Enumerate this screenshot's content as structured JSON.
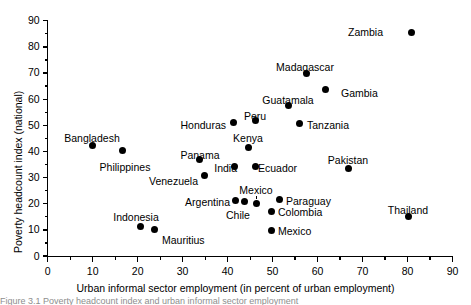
{
  "chart_data": {
    "type": "scatter",
    "title": "",
    "xlabel": "Urban informal sector employment (in percent of urban employment)",
    "ylabel": "Poverty headcount index (national)",
    "xlim": [
      0,
      90
    ],
    "ylim": [
      0,
      90
    ],
    "xticks": [
      0,
      10,
      20,
      30,
      40,
      50,
      60,
      70,
      80,
      90
    ],
    "yticks": [
      0,
      10,
      20,
      30,
      40,
      50,
      60,
      70,
      80,
      90
    ],
    "xtick_labels": [
      "0",
      "10",
      "20",
      "30",
      "40",
      "50",
      "60",
      "70",
      "80",
      "90"
    ],
    "ytick_labels": [
      "0",
      "10",
      "20",
      "30",
      "40",
      "50",
      "60",
      "70",
      "80",
      "90"
    ],
    "minor_ticks": true,
    "grid": false,
    "legend": "none",
    "marker": "filled-circle",
    "marker_color": "#000000",
    "points": [
      {
        "label": "Zambia",
        "x": 80.8,
        "y": 85.5,
        "lx": 383,
        "ly": 27,
        "anchor": "end"
      },
      {
        "label": "Madagascar",
        "x": 57.5,
        "y": 69.8,
        "lx": 305,
        "ly": 62,
        "anchor": "middle"
      },
      {
        "label": "Gambia",
        "x": 61.8,
        "y": 63.7,
        "lx": 341,
        "ly": 88,
        "anchor": "start"
      },
      {
        "label": "Guatamala",
        "x": 53.5,
        "y": 57.6,
        "lx": 288,
        "ly": 95,
        "anchor": "middle"
      },
      {
        "label": "Peru",
        "x": 46.2,
        "y": 51.7,
        "lx": 255,
        "ly": 111,
        "anchor": "middle"
      },
      {
        "label": "Tanzania",
        "x": 56.0,
        "y": 50.8,
        "lx": 307,
        "ly": 120,
        "anchor": "start"
      },
      {
        "label": "Honduras",
        "x": 41.3,
        "y": 51.1,
        "lx": 226,
        "ly": 120,
        "anchor": "end"
      },
      {
        "label": "Kenya",
        "x": 44.6,
        "y": 41.5,
        "lx": 248,
        "ly": 133,
        "anchor": "middle"
      },
      {
        "label": "Bangladesh",
        "x": 9.9,
        "y": 42.4,
        "lx": 92,
        "ly": 133,
        "anchor": "middle"
      },
      {
        "label": "Philippines",
        "x": 16.6,
        "y": 40.5,
        "lx": 125,
        "ly": 162,
        "anchor": "middle"
      },
      {
        "label": "Panama",
        "x": 33.8,
        "y": 37.1,
        "lx": 200,
        "ly": 150,
        "anchor": "middle"
      },
      {
        "label": "India",
        "x": 41.5,
        "y": 34.4,
        "lx": 237,
        "ly": 163,
        "anchor": "end"
      },
      {
        "label": "Ecuador",
        "x": 46.1,
        "y": 34.4,
        "lx": 258,
        "ly": 163,
        "anchor": "start"
      },
      {
        "label": "Pakistan",
        "x": 66.9,
        "y": 33.6,
        "lx": 348,
        "ly": 155,
        "anchor": "middle"
      },
      {
        "label": "Venezuela",
        "x": 34.8,
        "y": 30.8,
        "lx": 198,
        "ly": 176,
        "anchor": "end"
      },
      {
        "label": "Mexico",
        "x": 46.4,
        "y": 20.2,
        "lx": 256,
        "ly": 185,
        "anchor": "middle",
        "leader": true
      },
      {
        "label": "Argentina",
        "x": 41.8,
        "y": 21.3,
        "lx": 230,
        "ly": 197,
        "anchor": "end"
      },
      {
        "label": "Paraguay",
        "x": 51.5,
        "y": 21.6,
        "lx": 286,
        "ly": 196,
        "anchor": "start"
      },
      {
        "label": "Chile",
        "x": 43.8,
        "y": 20.7,
        "lx": 238,
        "ly": 210,
        "anchor": "middle"
      },
      {
        "label": "Colombia",
        "x": 49.8,
        "y": 17.0,
        "lx": 278,
        "ly": 207,
        "anchor": "start"
      },
      {
        "label": "Thailand",
        "x": 80.3,
        "y": 15.1,
        "lx": 408,
        "ly": 205,
        "anchor": "middle"
      },
      {
        "label": "Indonesia",
        "x": 20.7,
        "y": 11.1,
        "lx": 136,
        "ly": 212,
        "anchor": "middle"
      },
      {
        "label": "Mauritius",
        "x": 23.8,
        "y": 10.3,
        "lx": 162,
        "ly": 235,
        "anchor": "start"
      },
      {
        "label": "Mexico",
        "x": 49.7,
        "y": 9.7,
        "lx": 278,
        "ly": 226,
        "anchor": "start"
      }
    ]
  },
  "figure": {
    "caption": "Figure  3.1   Poverty headcount index and urban informal sector employment"
  }
}
